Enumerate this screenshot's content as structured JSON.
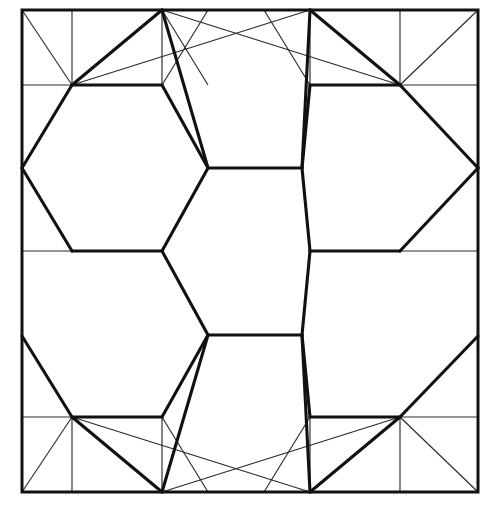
{
  "figure": {
    "width": 497,
    "height": 510,
    "background_color": "#ffffff",
    "line_color": "#111111",
    "thin_line_color": "#2b2b2b",
    "thick_stroke_width": 3.1,
    "thin_stroke_width": 1.15
  },
  "frame": {
    "name": "square-border",
    "left": 22,
    "top": 10,
    "right": 478,
    "bottom": 492,
    "width": 456,
    "height": 482
  },
  "lattice": {
    "hex_center_x": [
      72,
      236,
      400
    ],
    "hex_center_y": [
      10,
      251,
      492
    ],
    "center_hexagon": {
      "cx": 236,
      "cy": 251,
      "vertices": [
        [
          208,
          168
        ],
        [
          302,
          168
        ],
        [
          310,
          251
        ],
        [
          302,
          335
        ],
        [
          208,
          335
        ],
        [
          162,
          251
        ]
      ]
    },
    "hexagon_count": 7,
    "corner_nodes": [
      [
        72,
        85
      ],
      [
        400,
        85
      ],
      [
        72,
        417
      ],
      [
        400,
        417
      ]
    ],
    "edge_nodes": [
      [
        22,
        168
      ],
      [
        22,
        336
      ],
      [
        478,
        168
      ],
      [
        478,
        336
      ],
      [
        162,
        251
      ],
      [
        310,
        251
      ],
      [
        162,
        85
      ],
      [
        310,
        85
      ],
      [
        162,
        417
      ],
      [
        310,
        417
      ]
    ]
  },
  "hexagons": [
    {
      "name": "hexagon-center",
      "points": "208,168 302,168 310,251 302,335 208,335 162,251"
    },
    {
      "name": "hexagon-upper-left",
      "points": "72,85 162,85 208,168 162,251 72,251 22,168"
    },
    {
      "name": "hexagon-upper-right",
      "points": "310,85 400,85 478,168 400,251 310,251 302,168"
    },
    {
      "name": "hexagon-lower-left",
      "points": "72,251 162,251 208,335 162,417 72,417 22,336"
    },
    {
      "name": "hexagon-lower-right",
      "points": "310,251 400,251 478,336 400,417 310,417 302,335"
    },
    {
      "name": "hexagon-top-middle",
      "points": "162,85 310,85 302,168 208,168"
    },
    {
      "name": "hexagon-bottom-middle",
      "points": "208,335 302,335 310,417 162,417"
    }
  ],
  "thick_edges": [
    {
      "name": "edge-hex-center-top",
      "x1": 208,
      "y1": 168,
      "x2": 302,
      "y2": 168
    },
    {
      "name": "edge-hex-center-upper-right",
      "x1": 302,
      "y1": 168,
      "x2": 310,
      "y2": 251
    },
    {
      "name": "edge-hex-center-lower-right",
      "x1": 310,
      "y1": 251,
      "x2": 302,
      "y2": 335
    },
    {
      "name": "edge-hex-center-bottom",
      "x1": 302,
      "y1": 335,
      "x2": 208,
      "y2": 335
    },
    {
      "name": "edge-hex-center-lower-left",
      "x1": 208,
      "y1": 335,
      "x2": 162,
      "y2": 251
    },
    {
      "name": "edge-hex-center-upper-left",
      "x1": 162,
      "y1": 251,
      "x2": 208,
      "y2": 168
    },
    {
      "name": "edge-upper-left-top",
      "x1": 72,
      "y1": 85,
      "x2": 162,
      "y2": 85
    },
    {
      "name": "edge-upper-left-right-upper",
      "x1": 162,
      "y1": 85,
      "x2": 208,
      "y2": 168
    },
    {
      "name": "edge-upper-left-left-upper",
      "x1": 72,
      "y1": 85,
      "x2": 22,
      "y2": 168
    },
    {
      "name": "edge-upper-left-left-lower",
      "x1": 22,
      "y1": 168,
      "x2": 72,
      "y2": 251
    },
    {
      "name": "edge-upper-left-bottom",
      "x1": 72,
      "y1": 251,
      "x2": 162,
      "y2": 251
    },
    {
      "name": "edge-upper-right-top",
      "x1": 310,
      "y1": 85,
      "x2": 400,
      "y2": 85
    },
    {
      "name": "edge-upper-right-left-upper",
      "x1": 310,
      "y1": 85,
      "x2": 302,
      "y2": 168
    },
    {
      "name": "edge-upper-right-right-upper",
      "x1": 400,
      "y1": 85,
      "x2": 478,
      "y2": 168
    },
    {
      "name": "edge-upper-right-right-lower",
      "x1": 478,
      "y1": 168,
      "x2": 400,
      "y2": 251
    },
    {
      "name": "edge-upper-right-bottom",
      "x1": 400,
      "y1": 251,
      "x2": 310,
      "y2": 251
    },
    {
      "name": "edge-lower-left-bottom",
      "x1": 72,
      "y1": 417,
      "x2": 162,
      "y2": 417
    },
    {
      "name": "edge-lower-left-right-lower",
      "x1": 162,
      "y1": 417,
      "x2": 208,
      "y2": 335
    },
    {
      "name": "edge-lower-left-left-lower",
      "x1": 72,
      "y1": 417,
      "x2": 22,
      "y2": 336
    },
    {
      "name": "edge-lower-right-bottom",
      "x1": 310,
      "y1": 417,
      "x2": 400,
      "y2": 417
    },
    {
      "name": "edge-lower-right-left-lower",
      "x1": 310,
      "y1": 417,
      "x2": 302,
      "y2": 335
    },
    {
      "name": "edge-lower-right-right-lower",
      "x1": 400,
      "y1": 417,
      "x2": 478,
      "y2": 336
    },
    {
      "name": "edge-corner-tl-to-top",
      "x1": 72,
      "y1": 85,
      "x2": 162,
      "y2": 10
    },
    {
      "name": "edge-corner-tr-to-top",
      "x1": 400,
      "y1": 85,
      "x2": 310,
      "y2": 10
    },
    {
      "name": "edge-corner-bl-to-bottom",
      "x1": 72,
      "y1": 417,
      "x2": 162,
      "y2": 492
    },
    {
      "name": "edge-corner-br-to-bottom",
      "x1": 400,
      "y1": 417,
      "x2": 310,
      "y2": 492
    },
    {
      "name": "edge-top-middle-left",
      "x1": 162,
      "y1": 10,
      "x2": 208,
      "y2": 168
    },
    {
      "name": "edge-top-middle-right",
      "x1": 310,
      "y1": 10,
      "x2": 302,
      "y2": 168
    },
    {
      "name": "edge-bottom-middle-left",
      "x1": 162,
      "y1": 492,
      "x2": 208,
      "y2": 335
    },
    {
      "name": "edge-bottom-middle-right",
      "x1": 310,
      "y1": 492,
      "x2": 302,
      "y2": 335
    }
  ],
  "thin_edges": [
    {
      "name": "thin-tl-corner-diagonal",
      "x1": 22,
      "y1": 10,
      "x2": 72,
      "y2": 85
    },
    {
      "name": "thin-tl-vertical",
      "x1": 72,
      "y1": 10,
      "x2": 72,
      "y2": 85
    },
    {
      "name": "thin-tl-horizontal",
      "x1": 22,
      "y1": 85,
      "x2": 72,
      "y2": 85
    },
    {
      "name": "thin-tl-node-to-topmid",
      "x1": 72,
      "y1": 85,
      "x2": 310,
      "y2": 10
    },
    {
      "name": "thin-tl-topnode-to-node",
      "x1": 162,
      "y1": 10,
      "x2": 162,
      "y2": 85
    },
    {
      "name": "thin-tl-topmid-down",
      "x1": 162,
      "y1": 10,
      "x2": 208,
      "y2": 85
    },
    {
      "name": "thin-tl-slant-right",
      "x1": 162,
      "y1": 85,
      "x2": 208,
      "y2": 10
    },
    {
      "name": "thin-tr-corner-diagonal",
      "x1": 478,
      "y1": 10,
      "x2": 400,
      "y2": 85
    },
    {
      "name": "thin-tr-vertical",
      "x1": 400,
      "y1": 10,
      "x2": 400,
      "y2": 85
    },
    {
      "name": "thin-tr-horizontal",
      "x1": 400,
      "y1": 85,
      "x2": 478,
      "y2": 85
    },
    {
      "name": "thin-tr-node-to-topmid",
      "x1": 400,
      "y1": 85,
      "x2": 162,
      "y2": 10
    },
    {
      "name": "thin-tr-topnode-to-node",
      "x1": 310,
      "y1": 10,
      "x2": 310,
      "y2": 85
    },
    {
      "name": "thin-tr-slant-left",
      "x1": 310,
      "y1": 85,
      "x2": 264,
      "y2": 10
    },
    {
      "name": "thin-bl-corner-diagonal",
      "x1": 22,
      "y1": 492,
      "x2": 72,
      "y2": 417
    },
    {
      "name": "thin-bl-vertical",
      "x1": 72,
      "y1": 492,
      "x2": 72,
      "y2": 417
    },
    {
      "name": "thin-bl-horizontal",
      "x1": 22,
      "y1": 417,
      "x2": 72,
      "y2": 417
    },
    {
      "name": "thin-bl-node-to-botmid",
      "x1": 72,
      "y1": 417,
      "x2": 310,
      "y2": 492
    },
    {
      "name": "thin-bl-botnode-to-node",
      "x1": 162,
      "y1": 492,
      "x2": 162,
      "y2": 417
    },
    {
      "name": "thin-bl-slant-right",
      "x1": 162,
      "y1": 417,
      "x2": 208,
      "y2": 492
    },
    {
      "name": "thin-br-corner-diagonal",
      "x1": 478,
      "y1": 492,
      "x2": 400,
      "y2": 417
    },
    {
      "name": "thin-br-vertical",
      "x1": 400,
      "y1": 492,
      "x2": 400,
      "y2": 417
    },
    {
      "name": "thin-br-horizontal",
      "x1": 400,
      "y1": 417,
      "x2": 478,
      "y2": 417
    },
    {
      "name": "thin-br-node-to-botmid",
      "x1": 400,
      "y1": 417,
      "x2": 162,
      "y2": 492
    },
    {
      "name": "thin-br-botnode-to-node",
      "x1": 310,
      "y1": 492,
      "x2": 310,
      "y2": 417
    },
    {
      "name": "thin-br-slant-left",
      "x1": 310,
      "y1": 417,
      "x2": 264,
      "y2": 492
    }
  ],
  "stub_edges": [
    {
      "name": "stub-left-center",
      "x1": 22,
      "y1": 251,
      "x2": 72,
      "y2": 251
    },
    {
      "name": "stub-right-center",
      "x1": 400,
      "y1": 251,
      "x2": 478,
      "y2": 251
    }
  ]
}
